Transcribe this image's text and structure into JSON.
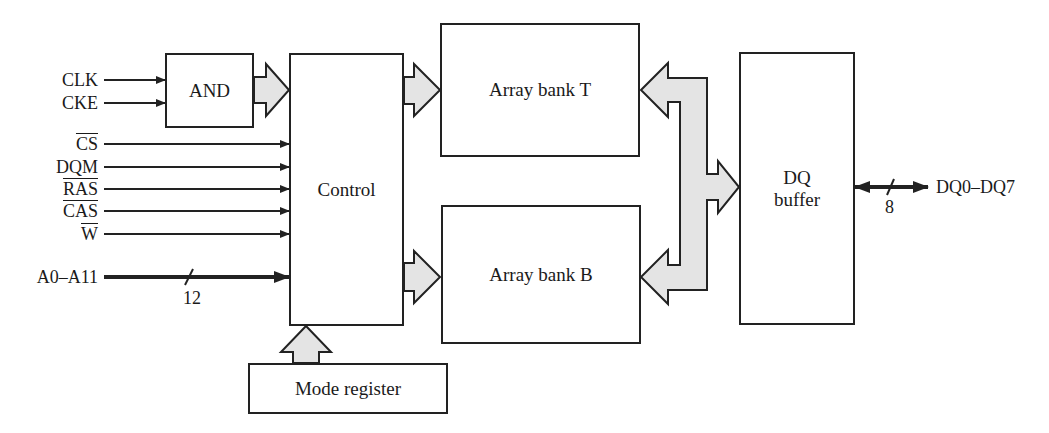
{
  "diagram": {
    "blocks": {
      "and_gate": {
        "label": "AND"
      },
      "control": {
        "label": "Control"
      },
      "array_bank_t": {
        "label": "Array bank T"
      },
      "array_bank_b": {
        "label": "Array bank B"
      },
      "dq_buffer": {
        "line1": "DQ",
        "line2": "buffer"
      },
      "mode_register": {
        "label": "Mode register"
      }
    },
    "inputs": [
      {
        "label": "CLK",
        "overline": false
      },
      {
        "label": "CKE",
        "overline": false
      },
      {
        "label": "CS",
        "overline": true
      },
      {
        "label": "DQM",
        "overline": false
      },
      {
        "label": "RAS",
        "overline": true
      },
      {
        "label": "CAS",
        "overline": true
      },
      {
        "label": "W",
        "overline": true
      },
      {
        "label": "A0–A11",
        "overline": false
      }
    ],
    "address_bus_width": "12",
    "data_bus": {
      "label": "DQ0–DQ7",
      "width": "8"
    },
    "colors": {
      "line": "#222222",
      "bus_fill": "#e4e4e4",
      "background": "#ffffff"
    }
  }
}
